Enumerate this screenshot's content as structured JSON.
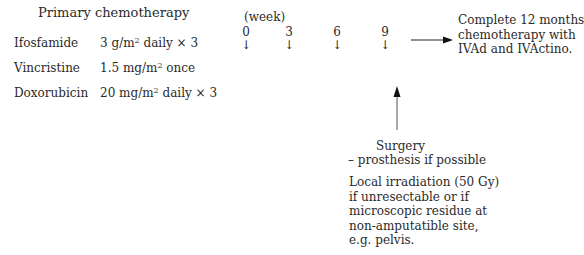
{
  "primary": {
    "title": "Primary chemotherapy",
    "drugs": [
      {
        "name": "Ifosfamide",
        "dose": "3 g/m",
        "sup": "2",
        "schedule": " daily × 3"
      },
      {
        "name": "Vincristine",
        "dose": "1.5 mg/m",
        "sup": "2",
        "schedule": " once"
      },
      {
        "name": "Doxorubicin",
        "dose": "20 mg/m",
        "sup": "2",
        "schedule": " daily × 3"
      }
    ]
  },
  "timeline": {
    "label": "(week)",
    "weeks": [
      "0",
      "3",
      "6",
      "9"
    ],
    "arrow_glyph": "↓"
  },
  "outcome": {
    "lines": [
      "Complete 12 months",
      "chemotherapy with",
      "IVAd and IVActino."
    ]
  },
  "surgery": {
    "title": "Surgery",
    "subtitle": "– prosthesis if possible"
  },
  "irradiation": {
    "lines": [
      "Local irradiation (50 Gy)",
      "if unresectable or if",
      "microscopic residue at",
      "non-amputatible site,",
      "e.g. pelvis."
    ]
  }
}
